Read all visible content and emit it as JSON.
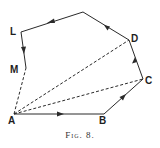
{
  "figure": {
    "caption": "Fig. 8.",
    "labels": {
      "A": "A",
      "B": "B",
      "C": "C",
      "D": "D",
      "L": "L",
      "M": "M"
    },
    "colors": {
      "line": "#2a2a2a",
      "background": "#ffffff"
    }
  }
}
